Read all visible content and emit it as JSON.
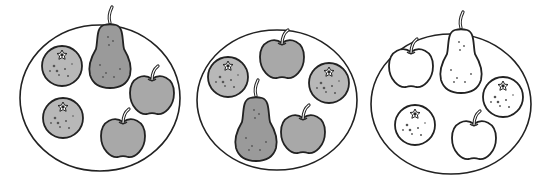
{
  "scene": {
    "title": "Three plates of fruit",
    "colors": {
      "outline": "#222222",
      "plate_fill": "#ffffff",
      "pear_shaded": "#9a9a9a",
      "apple_shaded": "#a8a8a8",
      "orange_shaded": "#b8b8b8",
      "unshaded": "#ffffff",
      "background": "#ffffff"
    }
  },
  "plates": [
    {
      "label": "plate-1",
      "shaded": true,
      "fruits": [
        {
          "type": "orange",
          "x": 62,
          "y": 66
        },
        {
          "type": "pear",
          "x": 110,
          "y": 55
        },
        {
          "type": "apple",
          "x": 152,
          "y": 93
        },
        {
          "type": "orange",
          "x": 63,
          "y": 118
        },
        {
          "type": "apple",
          "x": 123,
          "y": 136
        }
      ]
    },
    {
      "label": "plate-2",
      "shaded": true,
      "fruits": [
        {
          "type": "apple",
          "x": 282,
          "y": 57
        },
        {
          "type": "orange",
          "x": 228,
          "y": 77
        },
        {
          "type": "orange",
          "x": 329,
          "y": 83
        },
        {
          "type": "pear",
          "x": 256,
          "y": 128
        },
        {
          "type": "apple",
          "x": 303,
          "y": 132
        }
      ]
    },
    {
      "label": "plate-3",
      "shaded": false,
      "fruits": [
        {
          "type": "apple",
          "x": 411,
          "y": 66
        },
        {
          "type": "pear",
          "x": 461,
          "y": 60
        },
        {
          "type": "orange",
          "x": 503,
          "y": 97
        },
        {
          "type": "orange",
          "x": 415,
          "y": 125
        },
        {
          "type": "apple",
          "x": 474,
          "y": 138
        }
      ]
    }
  ]
}
